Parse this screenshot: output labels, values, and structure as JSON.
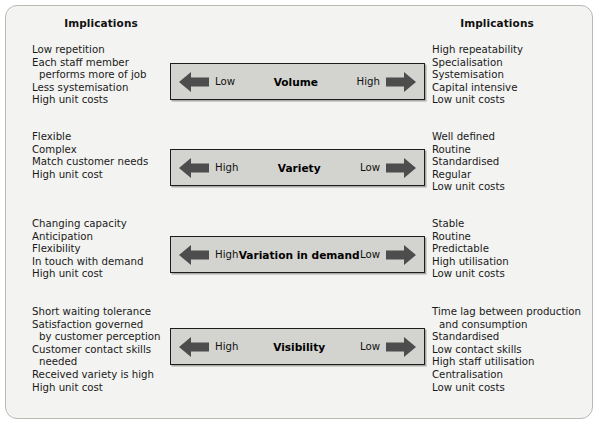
{
  "figure": {
    "background_color": "#f3f3f1",
    "bar_fill_color": "#d3d3cf",
    "bar_border_color": "#1d1d1d",
    "arrow_color": "#4d4d4d",
    "text_color": "#1a1a1a"
  },
  "headers": {
    "left": "Implications",
    "right": "Implications"
  },
  "rows": [
    {
      "dimension": "Volume",
      "left_end_label": "Low",
      "right_end_label": "High",
      "left_arrow_icon": "arrow-left-icon",
      "right_arrow_icon": "arrow-right-icon",
      "left_implications": [
        {
          "text": "Low repetition",
          "continuation": false
        },
        {
          "text": "Each staff member",
          "continuation": false
        },
        {
          "text": "performs more of job",
          "continuation": true
        },
        {
          "text": "Less systemisation",
          "continuation": false
        },
        {
          "text": "High unit costs",
          "continuation": false
        }
      ],
      "right_implications": [
        {
          "text": "High repeatability",
          "continuation": false
        },
        {
          "text": "Specialisation",
          "continuation": false
        },
        {
          "text": "Systemisation",
          "continuation": false
        },
        {
          "text": "Capital intensive",
          "continuation": false
        },
        {
          "text": "Low unit costs",
          "continuation": false
        }
      ]
    },
    {
      "dimension": "Variety",
      "left_end_label": "High",
      "right_end_label": "Low",
      "left_arrow_icon": "arrow-left-icon",
      "right_arrow_icon": "arrow-right-icon",
      "left_implications": [
        {
          "text": "Flexible",
          "continuation": false
        },
        {
          "text": "Complex",
          "continuation": false
        },
        {
          "text": "Match customer needs",
          "continuation": false
        },
        {
          "text": "High unit cost",
          "continuation": false
        }
      ],
      "right_implications": [
        {
          "text": "Well defined",
          "continuation": false
        },
        {
          "text": "Routine",
          "continuation": false
        },
        {
          "text": "Standardised",
          "continuation": false
        },
        {
          "text": "Regular",
          "continuation": false
        },
        {
          "text": "Low unit costs",
          "continuation": false
        }
      ]
    },
    {
      "dimension": "Variation in demand",
      "left_end_label": "High",
      "right_end_label": "Low",
      "left_arrow_icon": "arrow-left-icon",
      "right_arrow_icon": "arrow-right-icon",
      "left_implications": [
        {
          "text": "Changing capacity",
          "continuation": false
        },
        {
          "text": "Anticipation",
          "continuation": false
        },
        {
          "text": "Flexibility",
          "continuation": false
        },
        {
          "text": "In touch with demand",
          "continuation": false
        },
        {
          "text": "High unit cost",
          "continuation": false
        }
      ],
      "right_implications": [
        {
          "text": "Stable",
          "continuation": false
        },
        {
          "text": "Routine",
          "continuation": false
        },
        {
          "text": "Predictable",
          "continuation": false
        },
        {
          "text": "High utilisation",
          "continuation": false
        },
        {
          "text": "Low unit costs",
          "continuation": false
        }
      ]
    },
    {
      "dimension": "Visibility",
      "left_end_label": "High",
      "right_end_label": "Low",
      "left_arrow_icon": "arrow-left-icon",
      "right_arrow_icon": "arrow-right-icon",
      "left_implications": [
        {
          "text": "Short waiting tolerance",
          "continuation": false
        },
        {
          "text": "Satisfaction governed",
          "continuation": false
        },
        {
          "text": "by customer perception",
          "continuation": true
        },
        {
          "text": "Customer contact skills",
          "continuation": false
        },
        {
          "text": "needed",
          "continuation": true
        },
        {
          "text": "Received variety is high",
          "continuation": false
        },
        {
          "text": "High unit cost",
          "continuation": false
        }
      ],
      "right_implications": [
        {
          "text": "Time lag between production",
          "continuation": false
        },
        {
          "text": "and consumption",
          "continuation": true
        },
        {
          "text": "Standardised",
          "continuation": false
        },
        {
          "text": "Low contact skills",
          "continuation": false
        },
        {
          "text": "High staff utilisation",
          "continuation": false
        },
        {
          "text": "Centralisation",
          "continuation": false
        },
        {
          "text": "Low unit costs",
          "continuation": false
        }
      ]
    }
  ]
}
